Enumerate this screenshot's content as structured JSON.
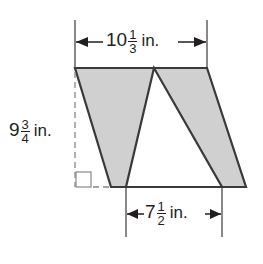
{
  "diagram": {
    "type": "parallelogram with shaded triangles",
    "colors": {
      "stroke": "#3a3a3a",
      "shade": "#d0d0d0",
      "text": "#231f20"
    },
    "dimensions": {
      "top_width": {
        "whole": "10",
        "num": "1",
        "den": "3",
        "unit": "in."
      },
      "height": {
        "whole": "9",
        "num": "3",
        "den": "4",
        "unit": "in."
      },
      "bottom_segment": {
        "whole": "7",
        "num": "1",
        "den": "2",
        "unit": "in."
      }
    },
    "shapes": {
      "parallelogram": "75,68 207,68 246,187 111,187",
      "left_shaded_triangle": "75,68 154,68 126,187 111,187",
      "right_shaded_triangle": "154,68 207,68 246,187 222,187",
      "white_triangle": "154,68 222,187 126,187"
    },
    "annotations": [
      "right-angle-marker",
      "dashed-height-line"
    ]
  }
}
